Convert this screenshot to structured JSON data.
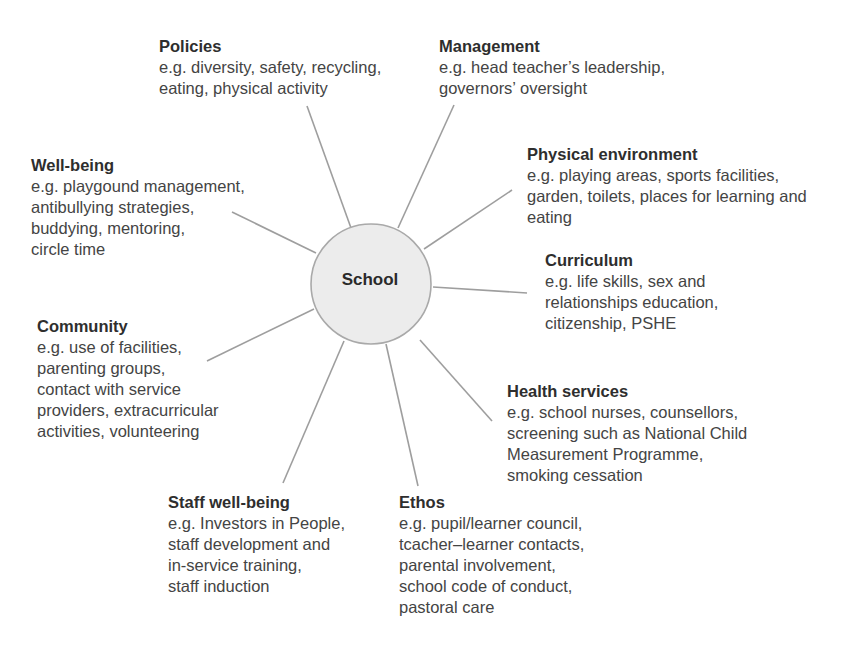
{
  "diagram": {
    "center": {
      "label": "School",
      "fill": "#ececec",
      "stroke": "#a9a9a9"
    },
    "line_color": "#9e9e9e",
    "nodes": {
      "policies": {
        "title": "Policies",
        "lines": [
          "e.g. diversity, safety, recycling,",
          "eating, physical activity"
        ]
      },
      "management": {
        "title": "Management",
        "lines": [
          "e.g. head teacher’s leadership,",
          "governors’ oversight"
        ]
      },
      "physical_environment": {
        "title": "Physical environment",
        "lines": [
          "e.g. playing areas, sports facilities,",
          "garden, toilets, places for learning and",
          "eating"
        ]
      },
      "curriculum": {
        "title": "Curriculum",
        "lines": [
          "e.g. life skills, sex and",
          "relationships education,",
          "citizenship, PSHE"
        ]
      },
      "well_being": {
        "title": "Well-being",
        "lines": [
          "e.g. playgound management,",
          "antibullying strategies,",
          "buddying, mentoring,",
          "circle time"
        ]
      },
      "community": {
        "title": "Community",
        "lines": [
          "e.g. use of facilities,",
          "parenting groups,",
          "contact with service",
          "providers, extracurricular",
          "activities, volunteering"
        ]
      },
      "health_services": {
        "title": "Health services",
        "lines": [
          "e.g. school nurses, counsellors,",
          "screening such as National Child",
          "Measurement Programme,",
          "smoking cessation"
        ]
      },
      "staff_well_being": {
        "title": "Staff well-being",
        "lines": [
          "e.g. Investors in People,",
          "staff development and",
          "in-service training,",
          "staff induction"
        ]
      },
      "ethos": {
        "title": "Ethos",
        "lines": [
          "e.g. pupil/learner council,",
          "tcacher–learner contacts,",
          "parental involvement,",
          "school code of conduct,",
          "pastoral care"
        ]
      }
    }
  }
}
